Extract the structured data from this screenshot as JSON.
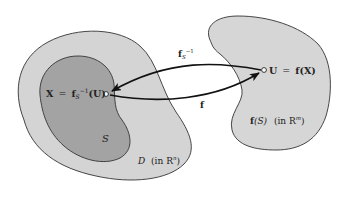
{
  "diagram": {
    "colors": {
      "outer_region_D": "#d4d4d4",
      "inner_region_S": "#a3a3a3",
      "image_region": "#d6d6d6",
      "stroke": "#333333",
      "arrow": "#111111",
      "point": "#ffffff"
    },
    "regions": {
      "D": {
        "label_main": "D",
        "label_suffix": "(in R",
        "label_sup": "n",
        "label_close": ")"
      },
      "S": {
        "label": "S"
      },
      "image": {
        "label_f": "f",
        "label_S": "(S)",
        "label_in": "(in R",
        "label_sup": "m",
        "label_close": ")"
      }
    },
    "points": {
      "X": {
        "lhs": "X",
        "eq": "=",
        "f": "f",
        "sub": "S",
        "sup": "−1",
        "arg": "(U)"
      },
      "U": {
        "lhs": "U",
        "eq": "=",
        "f": "f",
        "arg": "(X)"
      }
    },
    "arrows": {
      "inverse": {
        "f": "f",
        "sub": "S",
        "sup": "−1"
      },
      "forward": {
        "label": "f"
      }
    }
  }
}
